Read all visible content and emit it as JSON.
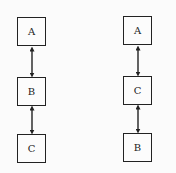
{
  "diagrams": [
    {
      "name": "left-chain",
      "nodes": [
        {
          "label": "A"
        },
        {
          "label": "B"
        },
        {
          "label": "C"
        }
      ],
      "edges": [
        {
          "from": "A",
          "to": "B",
          "type": "bidirectional"
        },
        {
          "from": "B",
          "to": "C",
          "type": "bidirectional"
        }
      ]
    },
    {
      "name": "right-chain",
      "nodes": [
        {
          "label": "A"
        },
        {
          "label": "C"
        },
        {
          "label": "B"
        }
      ],
      "edges": [
        {
          "from": "A",
          "to": "C",
          "type": "bidirectional"
        },
        {
          "from": "C",
          "to": "B",
          "type": "bidirectional"
        }
      ]
    }
  ]
}
